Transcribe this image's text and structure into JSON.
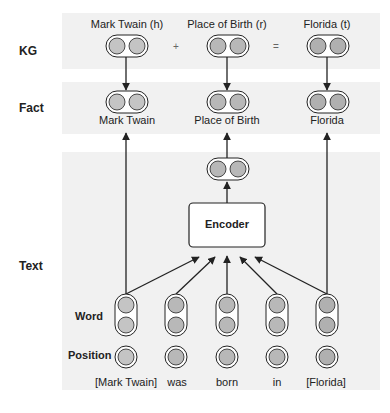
{
  "rows": {
    "kg": "KG",
    "fact": "Fact",
    "text": "Text",
    "word": "Word",
    "position": "Position"
  },
  "kg": {
    "head_label": "Mark Twain (h)",
    "relation_label": "Place of Birth (r)",
    "tail_label": "Florida (t)",
    "plus": "+",
    "equals": "="
  },
  "fact": {
    "head": "Mark Twain",
    "relation": "Place of Birth",
    "tail": "Florida"
  },
  "encoder": {
    "label": "Encoder"
  },
  "tokens": [
    "[Mark Twain]",
    "was",
    "born",
    "in",
    "[Florida]"
  ],
  "colors": {
    "panel": "#f1f1f1",
    "node_fill": "#c4c4c4",
    "stroke": "#222222"
  }
}
